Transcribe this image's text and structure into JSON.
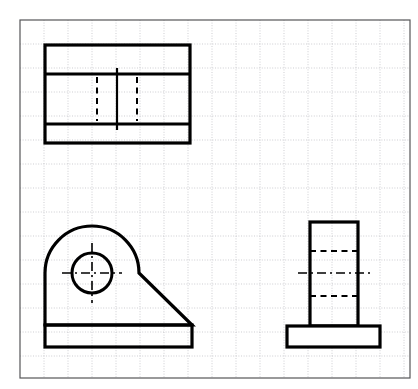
{
  "document": {
    "type": "orthographic-engineering-drawing",
    "title": "Third-angle orthographic projection of an angle bracket",
    "background_color": "#ffffff",
    "line_color": "#000000",
    "grid_color": "#b9b9bf",
    "canvas": {
      "width": 418,
      "height": 389
    }
  },
  "sheet": {
    "name": "grid-sheet",
    "border": {
      "x": 20,
      "y": 20,
      "width": 390,
      "height": 358,
      "stroke_width": 1.2
    },
    "grid": {
      "spacing": 24,
      "stroke_width": 0.7,
      "visible": true,
      "style": "dotted-fine"
    }
  },
  "views": {
    "top": {
      "name": "top-view",
      "label": "Top view",
      "outline": {
        "x": 45,
        "y": 45,
        "width": 145,
        "height": 98
      },
      "stroke_width": 3.2,
      "horizontal_lines": [
        {
          "name": "front-face-edge",
          "y": 74,
          "x1": 45,
          "x2": 190,
          "style": "solid"
        },
        {
          "name": "rear-face-edge",
          "y": 124,
          "x1": 45,
          "x2": 190,
          "style": "solid"
        }
      ],
      "center_line": {
        "name": "vertical-centerline",
        "x": 117,
        "y1": 68,
        "y2": 130,
        "style": "solid"
      },
      "hidden_lines": [
        {
          "name": "hole-left-hidden-edge",
          "x": 97,
          "y1": 77,
          "y2": 121,
          "style": "dashed"
        },
        {
          "name": "hole-right-hidden-edge",
          "x": 137,
          "y1": 77,
          "y2": 121,
          "style": "dashed"
        }
      ]
    },
    "front": {
      "name": "front-view",
      "label": "Front view",
      "stroke_width": 3.2,
      "body_path": "M 45,325 L 45,273 A 47,47 0 0 1 139,273 L 192,325 Z",
      "base_plate": {
        "x": 45,
        "y": 325,
        "width": 147,
        "height": 22
      },
      "base_top_line": {
        "y": 325,
        "x1": 45,
        "x2": 192
      },
      "hole": {
        "name": "through-hole",
        "cx": 92,
        "cy": 273,
        "r": 20,
        "stroke_width": 3.0
      },
      "center_lines": [
        {
          "name": "hole-horizontal-centerline",
          "x1": 62,
          "y1": 273,
          "x2": 122,
          "y2": 273,
          "style": "dash-dot"
        },
        {
          "name": "hole-vertical-centerline",
          "x1": 92,
          "y1": 243,
          "x2": 92,
          "y2": 303,
          "style": "dash-dot"
        }
      ],
      "arc": {
        "name": "rounded-top-arc",
        "center_x": 92,
        "center_y": 273,
        "radius": 47
      },
      "slant_edge": {
        "name": "chamfer-edge",
        "x1": 139,
        "y1": 239,
        "x2": 192,
        "y2": 325
      }
    },
    "side": {
      "name": "side-view",
      "label": "Right side view",
      "stroke_width": 3.2,
      "column": {
        "x": 310,
        "y": 222,
        "width": 48,
        "height": 104
      },
      "base_plate": {
        "x": 287,
        "y": 326,
        "width": 93,
        "height": 21
      },
      "hidden_lines": [
        {
          "name": "hole-top-hidden-edge",
          "y": 251,
          "x1": 310,
          "x2": 358,
          "style": "dashed"
        },
        {
          "name": "hole-bottom-hidden-edge",
          "y": 296,
          "x1": 310,
          "x2": 358,
          "style": "dashed"
        }
      ],
      "center_line": {
        "name": "hole-horizontal-centerline",
        "y": 273,
        "x1": 298,
        "x2": 370,
        "style": "dash-dot"
      }
    }
  }
}
